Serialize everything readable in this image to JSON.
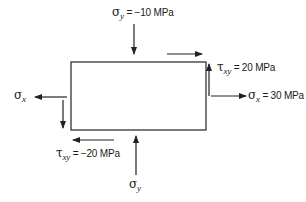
{
  "diagram": {
    "element": {
      "shape": "rectangle",
      "x": 71,
      "y": 62,
      "width": 135,
      "height": 68
    },
    "labels": {
      "sigma_y_top": {
        "symbol": "σ",
        "subscript": "y",
        "eq": " = −10  MPa"
      },
      "tau_xy_right": {
        "symbol": "τ",
        "subscript": "xy",
        "eq": " = 20 MPa"
      },
      "sigma_x_right": {
        "symbol": "σ",
        "subscript": "x",
        "eq": " = 30  MPa"
      },
      "sigma_x_left": {
        "symbol": "σ",
        "subscript": "x",
        "eq": ""
      },
      "tau_xy_bottom": {
        "symbol": "τ",
        "subscript": "xy",
        "eq": " = −20 MPa"
      },
      "sigma_y_bottom": {
        "symbol": "σ",
        "subscript": "y",
        "eq": ""
      }
    },
    "arrows": [
      {
        "name": "sigma-y-top-arrow",
        "direction": "down"
      },
      {
        "name": "tau-top-arrow",
        "direction": "right"
      },
      {
        "name": "tau-right-arrow",
        "direction": "up"
      },
      {
        "name": "sigma-x-right-arrow",
        "direction": "right"
      },
      {
        "name": "sigma-x-left-arrow",
        "direction": "left"
      },
      {
        "name": "tau-left-arrow",
        "direction": "down"
      },
      {
        "name": "tau-bottom-arrow",
        "direction": "left"
      },
      {
        "name": "sigma-y-bottom-arrow",
        "direction": "up"
      }
    ],
    "colors": {
      "line": "#222222",
      "background": "#ffffff"
    }
  }
}
